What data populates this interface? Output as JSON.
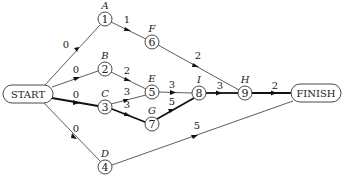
{
  "diagram": {
    "type": "activity-network",
    "start_label": "START",
    "finish_label": "FINISH",
    "nodes": [
      {
        "id": "1",
        "letter": "A",
        "x": 105,
        "y": 19
      },
      {
        "id": "2",
        "letter": "B",
        "x": 105,
        "y": 69
      },
      {
        "id": "3",
        "letter": "C",
        "x": 105,
        "y": 107
      },
      {
        "id": "4",
        "letter": "D",
        "x": 105,
        "y": 167
      },
      {
        "id": "5",
        "letter": "E",
        "x": 152,
        "y": 92
      },
      {
        "id": "6",
        "letter": "F",
        "x": 152,
        "y": 42
      },
      {
        "id": "7",
        "letter": "G",
        "x": 152,
        "y": 124
      },
      {
        "id": "8",
        "letter": "I",
        "x": 199,
        "y": 93
      },
      {
        "id": "9",
        "letter": "H",
        "x": 245,
        "y": 93
      }
    ],
    "edges": [
      {
        "from": "START",
        "to": "1",
        "weight": "0",
        "critical": false
      },
      {
        "from": "START",
        "to": "2",
        "weight": "0",
        "critical": false
      },
      {
        "from": "START",
        "to": "3",
        "weight": "0",
        "critical": true
      },
      {
        "from": "START",
        "to": "4",
        "weight": "0",
        "critical": false
      },
      {
        "from": "1",
        "to": "6",
        "weight": "1",
        "critical": false
      },
      {
        "from": "6",
        "to": "9",
        "weight": "2",
        "critical": false
      },
      {
        "from": "2",
        "to": "5",
        "weight": "2",
        "critical": false
      },
      {
        "from": "3",
        "to": "5",
        "weight": "3",
        "critical": false
      },
      {
        "from": "3",
        "to": "7",
        "weight": "3",
        "critical": true
      },
      {
        "from": "5",
        "to": "8",
        "weight": "3",
        "critical": false
      },
      {
        "from": "7",
        "to": "8",
        "weight": "5",
        "critical": true
      },
      {
        "from": "8",
        "to": "9",
        "weight": "3",
        "critical": true
      },
      {
        "from": "9",
        "to": "FINISH",
        "weight": "2",
        "critical": true
      },
      {
        "from": "4",
        "to": "FINISH",
        "weight": "5",
        "critical": false
      }
    ]
  }
}
